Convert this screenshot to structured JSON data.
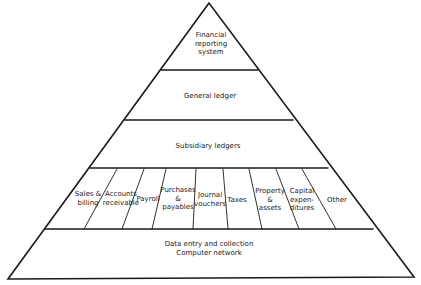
{
  "diagram": {
    "type": "pyramid",
    "levels": [
      {
        "id": "top",
        "lines": [
          "Financial",
          "reporting",
          "system"
        ]
      },
      {
        "id": "general-ledger",
        "lines": [
          "General ledger"
        ]
      },
      {
        "id": "subsidiary-ledgers",
        "lines": [
          "Subsidiary ledgers"
        ]
      },
      {
        "id": "subsystems",
        "cells": [
          {
            "lines": [
              "Sales &",
              "billing"
            ]
          },
          {
            "lines": [
              "Accounts",
              "receivable"
            ]
          },
          {
            "lines": [
              "Payroll"
            ]
          },
          {
            "lines": [
              "Purchases",
              "&",
              "payables"
            ]
          },
          {
            "lines": [
              "Journal",
              "vouchers"
            ]
          },
          {
            "lines": [
              "Taxes"
            ]
          },
          {
            "lines": [
              "Property",
              "&",
              "assets"
            ]
          },
          {
            "lines": [
              "Capital",
              "expen-",
              "ditures"
            ]
          },
          {
            "lines": [
              "Other"
            ]
          }
        ]
      },
      {
        "id": "base",
        "lines": [
          "Data entry and collection",
          "Computer network"
        ]
      }
    ],
    "colors": {
      "stroke": "#1a1a1a",
      "background": "#ffffff",
      "text": "#222222"
    }
  }
}
